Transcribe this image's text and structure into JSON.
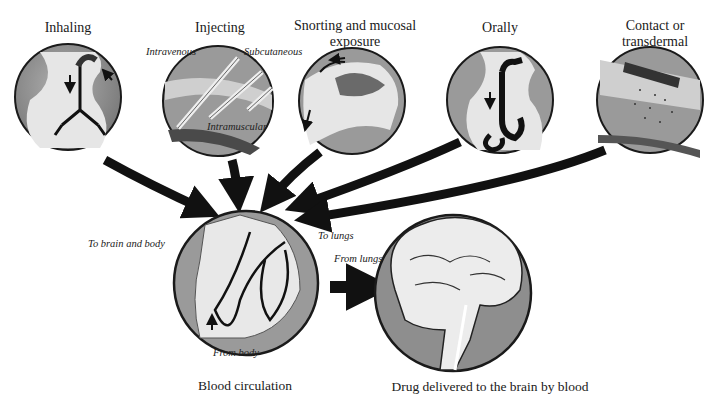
{
  "routes": [
    {
      "id": "inhaling",
      "title": "Inhaling"
    },
    {
      "id": "injecting",
      "title": "Injecting",
      "sublabels": [
        "Intravenous",
        "Subcutaneous",
        "Intramuscular"
      ]
    },
    {
      "id": "snorting",
      "title_line1": "Snorting and mucosal",
      "title_line2": "exposure"
    },
    {
      "id": "orally",
      "title": "Orally"
    },
    {
      "id": "contact",
      "title_line1": "Contact or",
      "title_line2": "transdermal"
    }
  ],
  "circulation": {
    "caption": "Blood circulation",
    "labels": {
      "to_brain": "To brain and body",
      "to_lungs": "To lungs",
      "from_lungs": "From lungs",
      "from_body": "From body"
    }
  },
  "brain": {
    "caption": "Drug delivered to the brain by blood"
  },
  "colors": {
    "circle_fill": "#8e8e8e",
    "organ_fill": "#e8e8e8",
    "arrow": "#111111",
    "outline": "#1a1a1a"
  }
}
